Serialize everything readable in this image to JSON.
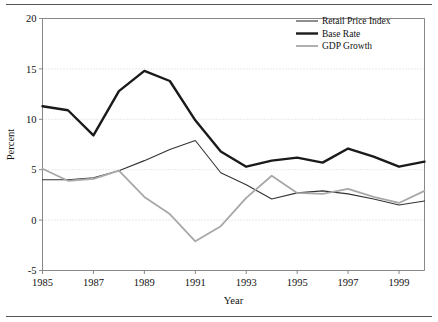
{
  "chart_data": {
    "type": "line",
    "title": "",
    "xlabel": "Year",
    "ylabel": "Percent",
    "xlim": [
      1985,
      2000
    ],
    "ylim": [
      -5,
      20
    ],
    "yticks": [
      -5,
      0,
      5,
      10,
      15,
      20
    ],
    "ytick_labels": [
      "-5",
      "0",
      "5",
      "10",
      "15",
      "20"
    ],
    "xticks": [
      1985,
      1987,
      1989,
      1991,
      1993,
      1995,
      1997,
      1999
    ],
    "xtick_labels": [
      "1985",
      "1987",
      "1989",
      "1991",
      "1993",
      "1995",
      "1997",
      "1999"
    ],
    "grid": "horizontal-dotted",
    "legend_position": "top-right",
    "x": [
      1985,
      1986,
      1987,
      1988,
      1989,
      1990,
      1991,
      1992,
      1993,
      1994,
      1995,
      1996,
      1997,
      1998,
      1999,
      2000
    ],
    "series": [
      {
        "name": "Retail Price Index",
        "color": "#333333",
        "width": 1.1,
        "values": [
          4.0,
          4.0,
          4.2,
          4.9,
          5.9,
          7.0,
          7.9,
          4.7,
          3.5,
          2.1,
          2.7,
          2.9,
          2.6,
          2.1,
          1.5,
          1.9
        ]
      },
      {
        "name": "Base Rate",
        "color": "#1a1a1a",
        "width": 2.4,
        "values": [
          11.3,
          10.9,
          8.4,
          12.8,
          14.8,
          13.8,
          9.9,
          6.8,
          5.3,
          5.9,
          6.2,
          5.7,
          7.1,
          6.3,
          5.3,
          5.8
        ]
      },
      {
        "name": "GDP Growth",
        "color": "#a8a8a8",
        "width": 1.8,
        "values": [
          5.1,
          3.9,
          4.1,
          4.9,
          2.3,
          0.6,
          -2.1,
          -0.6,
          2.2,
          4.4,
          2.7,
          2.6,
          3.1,
          2.3,
          1.7,
          2.9
        ]
      }
    ]
  },
  "legend": {
    "items": [
      {
        "label": "Retail Price Index"
      },
      {
        "label": "Base Rate"
      },
      {
        "label": "GDP Growth"
      }
    ]
  },
  "axes": {
    "y_title": "Percent",
    "x_title": "Year"
  }
}
